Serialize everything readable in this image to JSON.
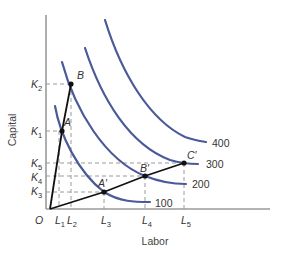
{
  "diagram": {
    "title": "",
    "x_axis": {
      "label": "Labor",
      "ticks": [
        {
          "name": "L",
          "sub": "1",
          "x": 59
        },
        {
          "name": "L",
          "sub": "2",
          "x": 71
        },
        {
          "name": "L",
          "sub": "3",
          "x": 104
        },
        {
          "name": "L",
          "sub": "4",
          "x": 145
        },
        {
          "name": "L",
          "sub": "5",
          "x": 184
        }
      ]
    },
    "y_axis": {
      "label": "Capital",
      "ticks": [
        {
          "name": "K",
          "sub": "2",
          "y": 84
        },
        {
          "name": "K",
          "sub": "1",
          "y": 131
        },
        {
          "name": "K",
          "sub": "5",
          "y": 163
        },
        {
          "name": "K",
          "sub": "4",
          "y": 176
        },
        {
          "name": "K",
          "sub": "3",
          "y": 191
        }
      ]
    },
    "origin_label": "O",
    "isoquants": [
      {
        "label": "100",
        "color": "#4a5a99"
      },
      {
        "label": "200",
        "color": "#4a5a99"
      },
      {
        "label": "300",
        "color": "#4a5a99"
      },
      {
        "label": "400",
        "color": "#4a5a99"
      }
    ],
    "points": [
      {
        "label": "A",
        "x": 62,
        "y": 131
      },
      {
        "label": "B",
        "x": 71,
        "y": 84
      },
      {
        "label": "A′",
        "x": 104,
        "y": 192
      },
      {
        "label": "B′",
        "x": 145,
        "y": 176
      },
      {
        "label": "C′",
        "x": 184,
        "y": 163
      }
    ],
    "rays": [
      "O-A-B (capital-intensive)",
      "O-A′-B′-C′ (labor-intensive)"
    ]
  },
  "labels": {
    "origin": "O",
    "xlabel": "Labor",
    "ylabel": "Capital",
    "q100": "100",
    "q200": "200",
    "q300": "300",
    "q400": "400",
    "A": "A",
    "B": "B",
    "Ap": "A′",
    "Bp": "B′",
    "Cp": "C′",
    "L": "L",
    "K": "K",
    "s1": "1",
    "s2": "2",
    "s3": "3",
    "s4": "4",
    "s5": "5"
  }
}
